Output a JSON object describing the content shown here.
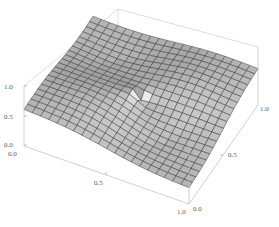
{
  "chart_data": {
    "type": "surface3d",
    "title": "",
    "xlabel": "",
    "ylabel": "",
    "zlabel": "",
    "x_range": [
      0.0,
      1.0
    ],
    "y_range": [
      0.0,
      1.0
    ],
    "z_range": [
      0.0,
      1.0
    ],
    "x_ticks": [
      "0.0",
      "0.5",
      "1.0"
    ],
    "y_ticks": [
      "0.0",
      "0.5",
      "1.0"
    ],
    "z_ticks": [
      "0.0",
      "0.5",
      "1.0"
    ],
    "grid": false,
    "legend": null,
    "mesh": true,
    "surface_color": "#a8a8a8",
    "mesh_color": "#2a2a2a",
    "box_color": "#c8c8c8",
    "approx_surface_samples": [
      {
        "x": 0.0,
        "y": 0.0,
        "z": 0.5
      },
      {
        "x": 0.0,
        "y": 1.0,
        "z": 0.55
      },
      {
        "x": 1.0,
        "y": 0.0,
        "z": 0.45
      },
      {
        "x": 1.0,
        "y": 1.0,
        "z": 0.5
      },
      {
        "x": 0.5,
        "y": 0.5,
        "z": 0.5
      },
      {
        "x": 0.5,
        "y": 0.0,
        "z": 0.3
      },
      {
        "x": 0.5,
        "y": 1.0,
        "z": 0.7
      }
    ]
  },
  "axes": {
    "z": {
      "labels": [
        "1.0",
        "0.5",
        "0.0"
      ]
    },
    "x": {
      "labels": [
        "0.0",
        "0.5",
        "1.0"
      ]
    },
    "y": {
      "labels": [
        "0.0",
        "0.5",
        "1.0"
      ]
    }
  }
}
